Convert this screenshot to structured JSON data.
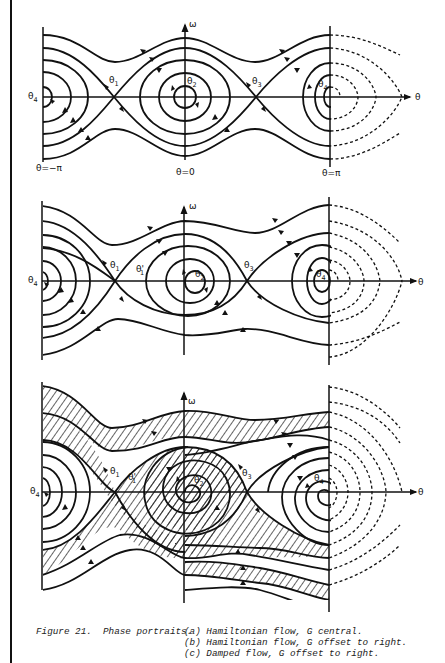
{
  "figure": {
    "number_label": "Figure 21.",
    "title": "Phase portraits.",
    "captions": [
      "(a) Hamiltonian flow, G central.",
      "(b) Hamiltonian flow, G offset to right.",
      "(c) Damped flow, G offset to right."
    ]
  },
  "axes": {
    "vertical_label": "ω",
    "horizontal_label": "θ"
  },
  "panel_a": {
    "name": "Hamiltonian flow, G central",
    "ticks": [
      "θ=−π",
      "θ=0",
      "θ=π"
    ],
    "points": [
      {
        "label": "θ",
        "sub": "4",
        "pos": "left"
      },
      {
        "label": "θ",
        "sub": "1",
        "pos": "saddle-left"
      },
      {
        "label": "θ",
        "sub": "2",
        "pos": "center"
      },
      {
        "label": "θ",
        "sub": "3",
        "pos": "saddle-right"
      },
      {
        "label": "θ",
        "sub": "4",
        "pos": "right"
      }
    ]
  },
  "panel_b": {
    "name": "Hamiltonian flow, G offset to right",
    "points": [
      {
        "label": "θ",
        "sub": "4"
      },
      {
        "label": "θ",
        "sub": "1"
      },
      {
        "label": "θ'",
        "sub": "1"
      },
      {
        "label": "θ",
        "sub": "2"
      },
      {
        "label": "θ",
        "sub": "3"
      },
      {
        "label": "θ",
        "sub": "4"
      }
    ]
  },
  "panel_c": {
    "name": "Damped flow, G offset to right",
    "points": [
      {
        "label": "θ",
        "sub": "4"
      },
      {
        "label": "θ",
        "sub": "1"
      },
      {
        "label": "θ'",
        "sub": "1"
      },
      {
        "label": "θ",
        "sub": "2"
      },
      {
        "label": "θ",
        "sub": "3"
      },
      {
        "label": "θ",
        "sub": "4"
      }
    ]
  },
  "colors": {
    "ink": "#111111",
    "background": "#ffffff"
  }
}
